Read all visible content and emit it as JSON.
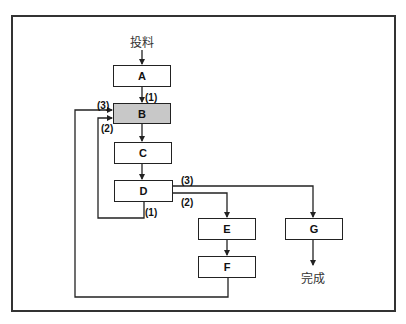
{
  "diagram": {
    "start_label": "投料",
    "end_label": "完成",
    "colors": {
      "line": "#222222",
      "highlight_fill": "#c8c8c8",
      "frame": "#333333"
    },
    "nodes": [
      {
        "id": "A",
        "label": "A"
      },
      {
        "id": "B",
        "label": "B",
        "highlight": true
      },
      {
        "id": "C",
        "label": "C"
      },
      {
        "id": "D",
        "label": "D"
      },
      {
        "id": "E",
        "label": "E"
      },
      {
        "id": "F",
        "label": "F"
      },
      {
        "id": "G",
        "label": "G"
      }
    ],
    "edge_labels": {
      "a_to_b": "(1)",
      "b_in_3": "(3)",
      "b_in_2": "(2)",
      "d_out_3": "(3)",
      "d_out_2": "(2)",
      "d_out_1": "(1)"
    },
    "edges": [
      {
        "from": "投料",
        "to": "A"
      },
      {
        "from": "A",
        "to": "B",
        "label": "(1)"
      },
      {
        "from": "B",
        "to": "C"
      },
      {
        "from": "C",
        "to": "D"
      },
      {
        "from": "D",
        "to": "B",
        "label": "(1)/(2)"
      },
      {
        "from": "D",
        "to": "E",
        "label": "(2)"
      },
      {
        "from": "D",
        "to": "G",
        "label": "(3)"
      },
      {
        "from": "E",
        "to": "F"
      },
      {
        "from": "F",
        "to": "B",
        "label": "(3)"
      },
      {
        "from": "G",
        "to": "完成"
      }
    ]
  }
}
